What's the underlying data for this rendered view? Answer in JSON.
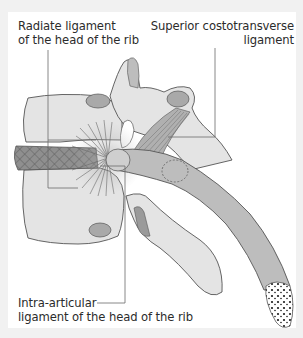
{
  "figure": {
    "colors": {
      "background": "#f1f1f1",
      "card": "#ffffff",
      "bone": "#e4e4e4",
      "bone_dark": "#c9c9c9",
      "cartilage": "#a9a9a9",
      "rib": "#bdbdbd",
      "outline": "#555555",
      "leader_line": "#6b6b6b",
      "text": "#2b2b2b"
    },
    "labels": [
      {
        "id": "radiate",
        "lines": [
          "Radiate ligament",
          "of the head of the rib"
        ]
      },
      {
        "id": "superior",
        "lines": [
          "Superior costotransverse",
          "ligament"
        ]
      },
      {
        "id": "intra",
        "lines": [
          "Intra-articular",
          "ligament of the head of the rib"
        ]
      }
    ]
  }
}
